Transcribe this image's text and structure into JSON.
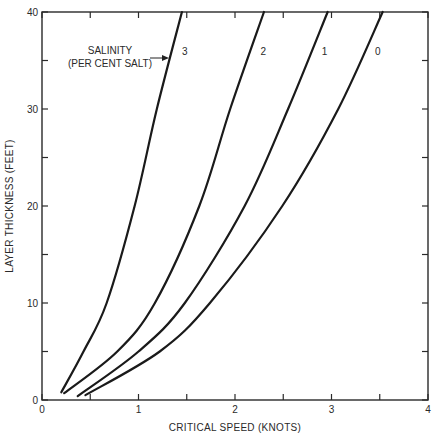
{
  "chart_data": {
    "type": "line",
    "title": "",
    "xlabel": "CRITICAL SPEED (KNOTS)",
    "ylabel": "LAYER THICKNESS (FEET)",
    "xlim": [
      0,
      4
    ],
    "ylim": [
      0,
      40
    ],
    "x_ticks": [
      0,
      1,
      2,
      3,
      4
    ],
    "x_minor_ticks": [
      0.5,
      1.5,
      2.5,
      3.5
    ],
    "y_ticks": [
      0,
      10,
      20,
      30,
      40
    ],
    "y_minor_ticks": [
      5,
      15,
      25,
      35
    ],
    "grid": false,
    "legend": null,
    "annotation": {
      "text_line1": "SALINITY",
      "text_line2": "(PER CENT SALT)",
      "points_to": "3"
    },
    "series": [
      {
        "name": "3",
        "x": [
          0.2,
          0.43,
          0.67,
          0.96,
          1.19,
          1.45
        ],
        "y": [
          0.8,
          5,
          10,
          20,
          30,
          40
        ]
      },
      {
        "name": "2",
        "x": [
          0.23,
          0.78,
          1.17,
          1.63,
          1.95,
          2.3
        ],
        "y": [
          0.7,
          5,
          10,
          20,
          30,
          40
        ]
      },
      {
        "name": "1",
        "x": [
          0.37,
          1.0,
          1.48,
          2.1,
          2.55,
          2.96
        ],
        "y": [
          0.4,
          5,
          10,
          20,
          30,
          40
        ]
      },
      {
        "name": "0",
        "x": [
          0.45,
          1.22,
          1.74,
          2.49,
          3.07,
          3.53
        ],
        "y": [
          0.5,
          5,
          10,
          20,
          30,
          40
        ]
      }
    ]
  },
  "labels": {
    "xlabel": "CRITICAL SPEED (KNOTS)",
    "ylabel": "LAYER THICKNESS (FEET)",
    "annot1": "SALINITY",
    "annot2": "(PER CENT SALT)"
  }
}
